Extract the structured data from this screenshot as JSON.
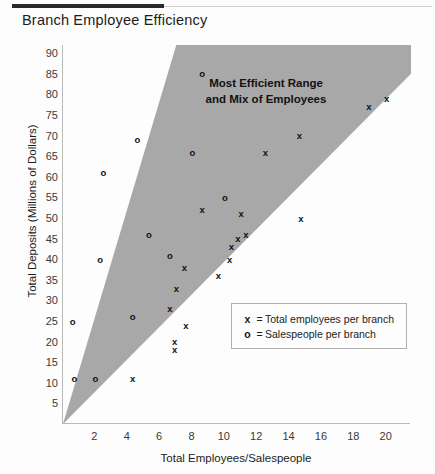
{
  "chart_title": "Branch Employee Efficiency",
  "annotation": {
    "line1": "Most Efficient Range",
    "line2": "and Mix of Employees"
  },
  "legend": {
    "items": [
      {
        "marker": "x",
        "eq": "=",
        "label": "Total employees per branch"
      },
      {
        "marker": "o",
        "eq": "=",
        "label": "Salespeople per branch"
      }
    ]
  },
  "colors": {
    "region_fill": "#a8a8a8",
    "axis": "#b9b9b9",
    "text": "#1c1c1c",
    "marker": "#111111",
    "rule_dark": "#2a2a2a",
    "rule_light": "#cfcfcf"
  },
  "chart_data": {
    "type": "scatter",
    "title": "Branch Employee Efficiency",
    "xlabel": "Total Employees/Salespeople",
    "ylabel": "Total Deposits (Millions of Dollars)",
    "xlim": [
      0,
      21.5
    ],
    "ylim": [
      0,
      92
    ],
    "xticks": [
      2,
      4,
      6,
      8,
      10,
      12,
      14,
      16,
      18,
      20
    ],
    "yticks": [
      5,
      10,
      15,
      20,
      25,
      30,
      35,
      40,
      45,
      50,
      55,
      60,
      65,
      70,
      75,
      80,
      85,
      90
    ],
    "grid": false,
    "legend_position": "lower-right",
    "annotations": [
      {
        "text": "Most Efficient Range and Mix of Employees",
        "x": 9.5,
        "y": 79
      }
    ],
    "shaded_region": {
      "label": "Most Efficient Range and Mix of Employees",
      "fill": "#a8a8a8",
      "polygon": [
        [
          0,
          0
        ],
        [
          7.0,
          92
        ],
        [
          21.5,
          92
        ],
        [
          21.5,
          85
        ]
      ]
    },
    "series": [
      {
        "name": "Total employees per branch",
        "marker": "x",
        "points": [
          [
            4.3,
            11
          ],
          [
            6.9,
            18
          ],
          [
            6.9,
            20
          ],
          [
            7.6,
            24
          ],
          [
            6.6,
            28
          ],
          [
            7.0,
            33
          ],
          [
            7.5,
            38
          ],
          [
            9.6,
            36
          ],
          [
            10.3,
            40
          ],
          [
            10.4,
            43
          ],
          [
            10.8,
            45
          ],
          [
            11.3,
            46
          ],
          [
            11.0,
            51
          ],
          [
            8.6,
            52
          ],
          [
            12.5,
            66
          ],
          [
            14.6,
            70
          ],
          [
            14.7,
            50
          ],
          [
            18.9,
            77
          ],
          [
            20.0,
            79
          ]
        ]
      },
      {
        "name": "Salespeople per branch",
        "marker": "o",
        "points": [
          [
            0.6,
            25
          ],
          [
            0.7,
            11
          ],
          [
            2.0,
            11
          ],
          [
            2.3,
            40
          ],
          [
            2.5,
            61
          ],
          [
            4.3,
            26
          ],
          [
            4.6,
            69
          ],
          [
            5.3,
            46
          ],
          [
            6.6,
            41
          ],
          [
            8.0,
            66
          ],
          [
            8.6,
            85
          ],
          [
            10.0,
            55
          ]
        ]
      }
    ]
  }
}
